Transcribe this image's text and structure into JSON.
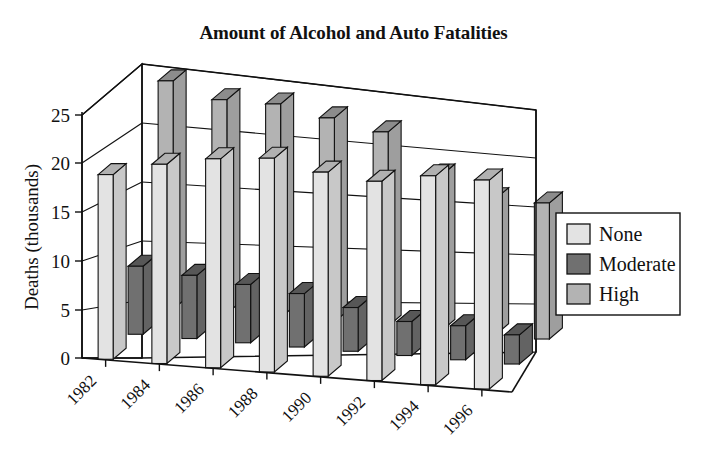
{
  "chart_data": {
    "type": "bar",
    "title": "Amount of Alcohol and Auto Fatalities",
    "xlabel": "",
    "ylabel": "Deaths (thousands)",
    "categories": [
      "1982",
      "1984",
      "1986",
      "1988",
      "1990",
      "1992",
      "1994",
      "1996"
    ],
    "ylim": [
      0,
      25
    ],
    "yticks": [
      0,
      5,
      10,
      15,
      20,
      25
    ],
    "ytick_labels": [
      "0",
      "5",
      "10",
      "15",
      "20",
      "25"
    ],
    "grid": true,
    "projection": "3d-depth",
    "legend_position": "right",
    "series": [
      {
        "name": "None",
        "color": "#e3e3e3",
        "values": [
          19.0,
          20.5,
          21.5,
          22.0,
          21.0,
          20.5,
          21.5,
          21.5
        ]
      },
      {
        "name": "Moderate",
        "color": "#707070",
        "values": [
          7.0,
          6.5,
          6.0,
          5.5,
          4.5,
          3.5,
          3.5,
          3.0
        ]
      },
      {
        "name": "High",
        "color": "#b3b3b3",
        "values": [
          23.5,
          22.0,
          22.0,
          21.0,
          20.0,
          16.0,
          14.0,
          14.0
        ]
      }
    ]
  },
  "legend": {
    "entries": [
      {
        "label": "None",
        "color": "#e3e3e3"
      },
      {
        "label": "Moderate",
        "color": "#707070"
      },
      {
        "label": "High",
        "color": "#b3b3b3"
      }
    ]
  }
}
